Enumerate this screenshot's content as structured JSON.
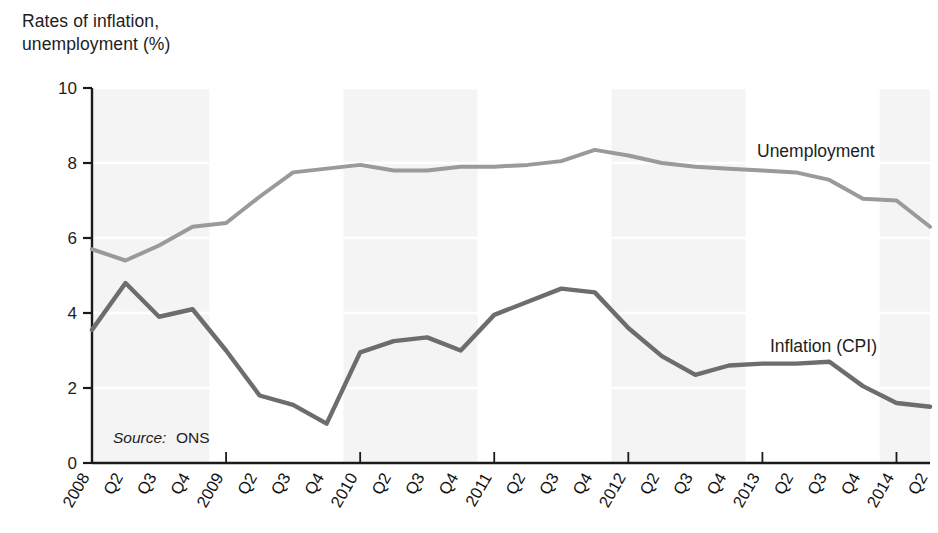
{
  "chart_data": {
    "type": "line",
    "title": "Rates of inflation,\nunemployment (%)",
    "xlabel": "",
    "ylabel": "Rates of inflation, unemployment (%)",
    "ylim": [
      0,
      10
    ],
    "yticks": [
      0,
      2,
      4,
      6,
      8,
      10
    ],
    "ytick_labels": [
      "0",
      "2",
      "4",
      "6",
      "8",
      "10"
    ],
    "grid": false,
    "legend_position": "inline-right",
    "categories": [
      "2008",
      "Q2",
      "Q3",
      "Q4",
      "2009",
      "Q2",
      "Q3",
      "Q4",
      "2010",
      "Q2",
      "Q3",
      "Q4",
      "2011",
      "Q2",
      "Q3",
      "Q4",
      "2012",
      "Q2",
      "Q3",
      "Q4",
      "2013",
      "Q2",
      "Q3",
      "Q4",
      "2014",
      "Q2"
    ],
    "series": [
      {
        "name": "Unemployment",
        "color": "#9a9a9a",
        "values": [
          5.7,
          5.4,
          5.8,
          6.3,
          6.4,
          7.1,
          7.75,
          7.85,
          7.95,
          7.8,
          7.8,
          7.9,
          7.9,
          7.95,
          8.05,
          8.35,
          8.2,
          8.0,
          7.9,
          7.85,
          7.8,
          7.75,
          7.55,
          7.05,
          7.0,
          6.3
        ]
      },
      {
        "name": "Inflation (CPI)",
        "color": "#6d6d6d",
        "values": [
          3.55,
          4.8,
          3.9,
          4.1,
          3.0,
          1.8,
          1.55,
          1.05,
          2.95,
          3.25,
          3.35,
          3.0,
          3.95,
          4.3,
          4.65,
          4.55,
          3.6,
          2.85,
          2.35,
          2.6,
          2.65,
          2.65,
          2.7,
          2.05,
          1.6,
          1.5
        ]
      }
    ],
    "annotations": [
      {
        "id": "source",
        "prefix": "Source:",
        "text": "ONS"
      }
    ]
  },
  "labels": {
    "unemployment_label": "Unemployment",
    "inflation_label": "Inflation (CPI)"
  }
}
